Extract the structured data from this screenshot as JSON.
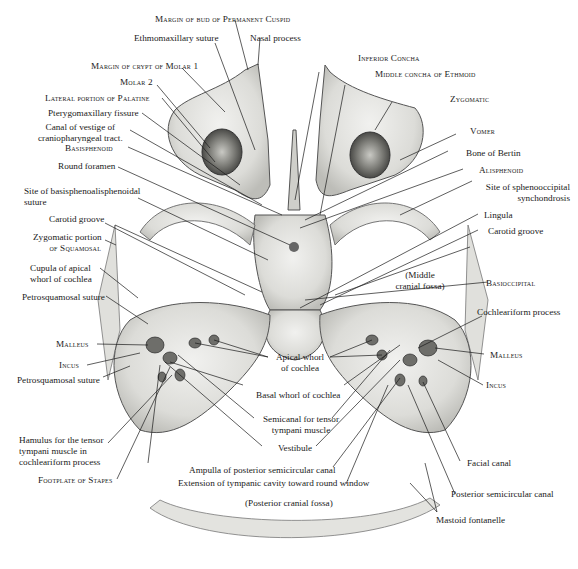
{
  "figure": {
    "regions": {
      "middle_fossa": "(Middle cranial fossa)",
      "posterior_fossa": "(Posterior cranial fossa)"
    }
  },
  "labels": {
    "cuspid_margin": "Margin of bud of Permanent Cuspid",
    "ethmomaxillary": "Ethmomaxillary suture",
    "nasal_process": "Nasal process",
    "molar1_margin": "Margin of crypt of Molar 1",
    "molar2": "Molar 2",
    "palatine": "Lateral portion of Palatine",
    "pterygomaxillary": "Pterygomaxillary fissure",
    "canal_vestige_1": "Canal of vestige of",
    "canal_vestige_2": "craniopharyngeal tract.",
    "basisphenoid": "Basisphenoid",
    "round_foramen": "Round foramen",
    "site_basi_1": "Site of basisphenoalisphenoidal",
    "site_basi_2": "suture",
    "carotid_left": "Carotid groove",
    "zygomatic_portion_1": "Zygomatic portion",
    "zygomatic_portion_2": "of Squamosal",
    "cupula_1": "Cupula of apical",
    "cupula_2": "whorl of cochlea",
    "petrosquamosal_upper": "Petrosquamosal suture",
    "malleus_left": "Malleus",
    "incus_left": "Incus",
    "petrosquamosal_lower": "Petrosquamosal suture",
    "hamulus_1": "Hamulus for the tensor",
    "hamulus_2": "tympani muscle in",
    "hamulus_3": "cochleariform process",
    "stapes": "Footplate of Stapes",
    "inferior_concha": "Inferior Concha",
    "middle_concha": "Middle concha of Ethmoid",
    "zygomatic": "Zygomatic",
    "vomer": "Vomer",
    "bertin": "Bone of Bertin",
    "alisphenoid": "Alisphenoid",
    "spheno_1": "Site of sphenooccipital",
    "spheno_2": "synchondrosis",
    "lingula": "Lingula",
    "carotid_right": "Carotid groove",
    "middle_fossa_1": "(Middle",
    "middle_fossa_2": "cranial fossa)",
    "basioccipital": "Basioccipital",
    "cochleariform": "Cochleariform process",
    "malleus_right": "Malleus",
    "incus_right": "Incus",
    "apical_1": "Apical whorl",
    "apical_2": "of cochlea",
    "basal_whorl": "Basal whorl of cochlea",
    "semicanal_1": "Semicanal for tensor",
    "semicanal_2": "tympani muscle",
    "vestibule": "Vestibule",
    "ampulla": "Ampulla of posterior semicircular canal",
    "extension": "Extension of tympanic cavity toward round window",
    "posterior_fossa": "(Posterior cranial fossa)",
    "facial_canal": "Facial canal",
    "post_semicircular": "Posterior semicircular canal",
    "mastoid": "Mastoid fontanelle"
  }
}
